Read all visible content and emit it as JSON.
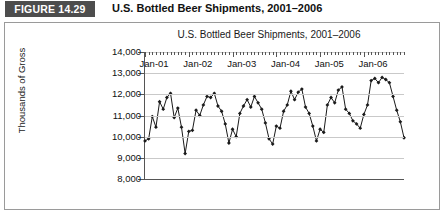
{
  "header": {
    "figure_badge": "FIGURE 14.29",
    "figure_title": "U.S. Bottled Beer Shipments, 2001–2006"
  },
  "chart_data": {
    "type": "line",
    "title": "U.S. Bottled Beer Shipments, 2001–2006",
    "xlabel": "",
    "ylabel": "Thousands of Gross",
    "ylim": [
      8000,
      14000
    ],
    "yticks": [
      8000,
      9000,
      10000,
      11000,
      12000,
      13000,
      14000
    ],
    "ytick_labels": [
      "8,000",
      "9,000",
      "10,000",
      "11,000",
      "12,000",
      "13,000",
      "14,000"
    ],
    "xtick_labels": [
      "Jan-01",
      "Jan-02",
      "Jan-03",
      "Jan-04",
      "Jan-05",
      "Jan-06"
    ],
    "grid": true,
    "legend": false,
    "marker": "diamond",
    "line_color": "#1a1a1a",
    "grid_color": "#c9c9c9",
    "x": [
      "Jan-01",
      "Feb-01",
      "Mar-01",
      "Apr-01",
      "May-01",
      "Jun-01",
      "Jul-01",
      "Aug-01",
      "Sep-01",
      "Oct-01",
      "Nov-01",
      "Dec-01",
      "Jan-02",
      "Feb-02",
      "Mar-02",
      "Apr-02",
      "May-02",
      "Jun-02",
      "Jul-02",
      "Aug-02",
      "Sep-02",
      "Oct-02",
      "Nov-02",
      "Dec-02",
      "Jan-03",
      "Feb-03",
      "Mar-03",
      "Apr-03",
      "May-03",
      "Jun-03",
      "Jul-03",
      "Aug-03",
      "Sep-03",
      "Oct-03",
      "Nov-03",
      "Dec-03",
      "Jan-04",
      "Feb-04",
      "Mar-04",
      "Apr-04",
      "May-04",
      "Jun-04",
      "Jul-04",
      "Aug-04",
      "Sep-04",
      "Oct-04",
      "Nov-04",
      "Dec-04",
      "Jan-05",
      "Feb-05",
      "Mar-05",
      "Apr-05",
      "May-05",
      "Jun-05",
      "Jul-05",
      "Aug-05",
      "Sep-05",
      "Oct-05",
      "Nov-05",
      "Dec-05",
      "Jan-06",
      "Feb-06",
      "Mar-06",
      "Apr-06",
      "May-06",
      "Jun-06",
      "Jul-06",
      "Aug-06",
      "Sep-06",
      "Oct-06",
      "Nov-06",
      "Dec-06"
    ],
    "values": [
      9800,
      9900,
      10950,
      10450,
      11650,
      11300,
      11850,
      12050,
      10900,
      11350,
      10450,
      9200,
      10250,
      10300,
      11250,
      11000,
      11500,
      11900,
      11850,
      12050,
      11450,
      11200,
      10600,
      9700,
      10350,
      10000,
      11100,
      11450,
      11750,
      11400,
      11900,
      11600,
      11300,
      10650,
      9900,
      9650,
      10500,
      10400,
      11200,
      11500,
      12150,
      11750,
      12100,
      12250,
      11400,
      11100,
      10500,
      9800,
      10350,
      10200,
      11500,
      11850,
      11600,
      12200,
      12350,
      11300,
      11100,
      10750,
      10600,
      10400,
      11050,
      11500,
      12650,
      12750,
      12550,
      12800,
      12700,
      12550,
      11900,
      11250,
      10700,
      9950
    ],
    "series": [
      {
        "name": "U.S. Bottled Beer Shipments",
        "values": [
          9800,
          9900,
          10950,
          10450,
          11650,
          11300,
          11850,
          12050,
          10900,
          11350,
          10450,
          9200,
          10250,
          10300,
          11250,
          11000,
          11500,
          11900,
          11850,
          12050,
          11450,
          11200,
          10600,
          9700,
          10350,
          10000,
          11100,
          11450,
          11750,
          11400,
          11900,
          11600,
          11300,
          10650,
          9900,
          9650,
          10500,
          10400,
          11200,
          11500,
          12150,
          11750,
          12100,
          12250,
          11400,
          11100,
          10500,
          9800,
          10350,
          10200,
          11500,
          11850,
          11600,
          12200,
          12350,
          11300,
          11100,
          10750,
          10600,
          10400,
          11050,
          11500,
          12650,
          12750,
          12550,
          12800,
          12700,
          12550,
          11900,
          11250,
          10700,
          9950
        ]
      }
    ]
  }
}
